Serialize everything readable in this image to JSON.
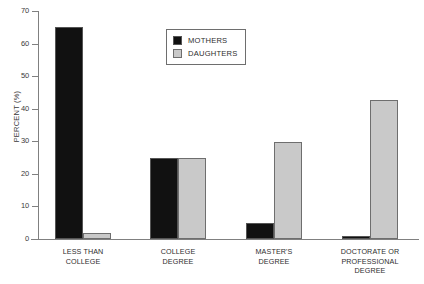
{
  "chart_data": {
    "type": "bar",
    "title": "",
    "subtitle": "",
    "xlabel": "",
    "ylabel": "PERCENT (%)",
    "ylim": [
      0,
      70
    ],
    "ytick_step": 10,
    "yticks": [
      0,
      10,
      20,
      30,
      40,
      50,
      60,
      70
    ],
    "ytick_labels": [
      "0",
      "10",
      "20",
      "30",
      "40",
      "50",
      "60",
      "70"
    ],
    "grid": false,
    "legend_position": "upper center",
    "categories": [
      "LESS THAN\nCOLLEGE",
      "COLLEGE\nDEGREE",
      "MASTER'S\nDEGREE",
      "DOCTORATE OR\nPROFESSIONAL\nDEGREE"
    ],
    "series": [
      {
        "name": "MOTHERS",
        "color": "#111111",
        "values": [
          65,
          24.8,
          5,
          1
        ]
      },
      {
        "name": "DAUGHTERS",
        "color": "#c9c9c9",
        "values": [
          2,
          24.8,
          29.8,
          42.7
        ]
      }
    ]
  },
  "legend": {
    "items": [
      {
        "label": "MOTHERS",
        "swatch": "mothers"
      },
      {
        "label": "DAUGHTERS",
        "swatch": "daughters"
      }
    ]
  },
  "colors": {
    "mothers": "#111111",
    "daughters": "#c9c9c9",
    "axis": "#808080",
    "text": "#2e2e2e",
    "background": "#ffffff"
  }
}
